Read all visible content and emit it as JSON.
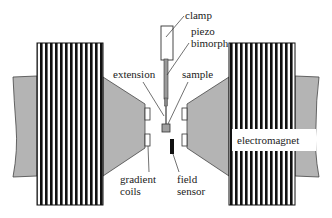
{
  "diagram": {
    "type": "apparatus-schematic",
    "colors": {
      "pole_gray": "#b4b4b4",
      "coil_black": "#111111",
      "coil_white": "#ffffff",
      "line": "#333333",
      "sensor": "#111111"
    },
    "labels": {
      "clamp": "clamp",
      "piezo_line1": "piezo",
      "piezo_line2": "bimorph",
      "extension": "extension",
      "sample": "sample",
      "gradient_line1": "gradient",
      "gradient_line2": "coils",
      "field_line1": "field",
      "field_line2": "sensor",
      "electromagnet": "electromagnet"
    },
    "components": [
      {
        "id": "left-coil",
        "name": "electromagnet coil (left)"
      },
      {
        "id": "right-coil",
        "name": "electromagnet coil (right)"
      },
      {
        "id": "left-pole",
        "name": "pole piece (left)"
      },
      {
        "id": "right-pole",
        "name": "pole piece (right)"
      },
      {
        "id": "clamp",
        "name": "clamp"
      },
      {
        "id": "piezo-bimorph",
        "name": "piezo bimorph"
      },
      {
        "id": "extension",
        "name": "extension"
      },
      {
        "id": "sample",
        "name": "sample"
      },
      {
        "id": "gradient-coils",
        "name": "gradient coils"
      },
      {
        "id": "field-sensor",
        "name": "field sensor"
      }
    ]
  }
}
